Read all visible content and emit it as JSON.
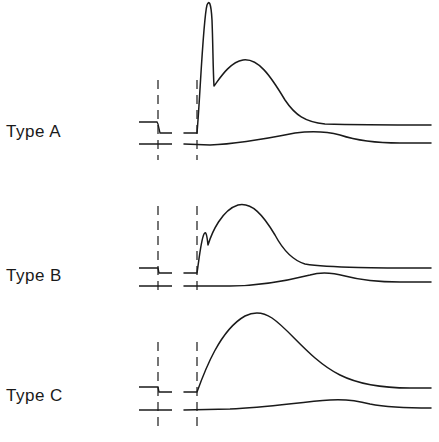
{
  "diagram": {
    "type": "waveform-comparison",
    "panels": [
      {
        "label": "Type A",
        "description": "Sharp initial spike followed by a rounded secondary hump; lower reference trace with gentle delayed hump",
        "upper_trace": {
          "baseline_left": 122,
          "step_level": 133,
          "spike_peak": 3,
          "dip": 85,
          "hump_peak": 60,
          "tail": 125
        },
        "lower_trace": {
          "baseline": 144,
          "hump_peak": 132,
          "tail": 143
        }
      },
      {
        "label": "Type B",
        "description": "Small notch/bump on the rising edge followed by a large rounded hump; lower trace with delayed hump",
        "upper_trace": {
          "baseline_left": 268,
          "step_level": 273,
          "bump_peak": 232,
          "dip": 245,
          "hump_peak": 205,
          "tail": 268
        },
        "lower_trace": {
          "baseline": 286,
          "hump_peak": 272,
          "tail": 282
        }
      },
      {
        "label": "Type C",
        "description": "Single smooth broad hump with no initial spike; lower trace with delayed hump",
        "upper_trace": {
          "baseline_left": 387,
          "step_level": 392,
          "hump_peak": 313,
          "tail": 388
        },
        "lower_trace": {
          "baseline": 410,
          "hump_peak": 399,
          "tail": 408
        }
      }
    ],
    "markers": [
      {
        "name": "dashed-marker-1",
        "x": 158
      },
      {
        "name": "dashed-marker-2",
        "x": 197
      }
    ]
  }
}
